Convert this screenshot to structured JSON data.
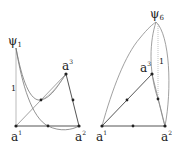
{
  "figures": [
    {
      "name": "left",
      "apex": {
        "base": "ψ",
        "index": "1"
      },
      "vertices": [
        {
          "base": "a",
          "index": "1"
        },
        {
          "base": "a",
          "index": "2"
        },
        {
          "base": "a",
          "index": "3"
        }
      ],
      "edge_label": "1"
    },
    {
      "name": "right",
      "apex": {
        "base": "ψ",
        "index": "6"
      },
      "vertices": [
        {
          "base": "a",
          "index": "1"
        },
        {
          "base": "a",
          "index": "2"
        },
        {
          "base": "a",
          "index": "3"
        }
      ],
      "edge_label": "1"
    }
  ],
  "colors": {
    "line": "#555555",
    "thin": "#999999",
    "point": "#222222"
  }
}
